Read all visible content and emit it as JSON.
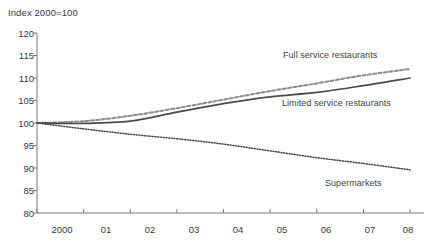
{
  "chart_data": {
    "type": "line",
    "title": "",
    "ylabel": "Index 2000=100",
    "xlabel": "",
    "ylim": [
      80,
      120
    ],
    "yticks": [
      80,
      85,
      90,
      95,
      100,
      105,
      110,
      115,
      120
    ],
    "grid": false,
    "legend_position": "inline-annotations",
    "x": [
      "2000",
      "01",
      "02",
      "03",
      "04",
      "05",
      "06",
      "07",
      "08"
    ],
    "xtick_labels": [
      "2000",
      "01",
      "02",
      "03",
      "04",
      "05",
      "06",
      "07",
      "08"
    ],
    "series": [
      {
        "name": "Full service restaurants",
        "style": "dashed",
        "color": "#8d8d8d",
        "values": [
          100.0,
          100.4,
          101.6,
          103.3,
          105.2,
          107.1,
          108.8,
          110.6,
          112.0
        ]
      },
      {
        "name": "Limited service restaurants",
        "style": "solid",
        "color": "#4a4a4a",
        "values": [
          100.0,
          99.9,
          100.4,
          102.4,
          104.3,
          105.8,
          106.8,
          108.3,
          110.0
        ]
      },
      {
        "name": "Supermarkets",
        "style": "dotted",
        "color": "#4a4a4a",
        "values": [
          100.0,
          98.7,
          97.5,
          96.5,
          95.3,
          93.8,
          92.3,
          91.0,
          89.6
        ]
      }
    ],
    "annotations": [
      {
        "text": "Full service restaurants",
        "series": "Full service restaurants"
      },
      {
        "text": "Limited service restaurants",
        "series": "Limited service restaurants"
      },
      {
        "text": "Supermarkets",
        "series": "Supermarkets"
      }
    ]
  },
  "axis": {
    "y_title": "Index 2000=100",
    "y_labels": [
      "120",
      "115",
      "110",
      "105",
      "100",
      "95",
      "90",
      "85",
      "80"
    ],
    "x_labels": [
      "2000",
      "01",
      "02",
      "03",
      "04",
      "05",
      "06",
      "07",
      "08"
    ]
  },
  "labels": {
    "full_service": "Full service restaurants",
    "limited_service": "Limited service restaurants",
    "supermarkets": "Supermarkets"
  },
  "caption": {
    "text": ""
  },
  "colors": {
    "axis": "#7a7a7a",
    "text": "#3a3a3a",
    "full_service": "#8d8d8d",
    "limited_service": "#4a4a4a",
    "supermarkets": "#4a4a4a"
  }
}
